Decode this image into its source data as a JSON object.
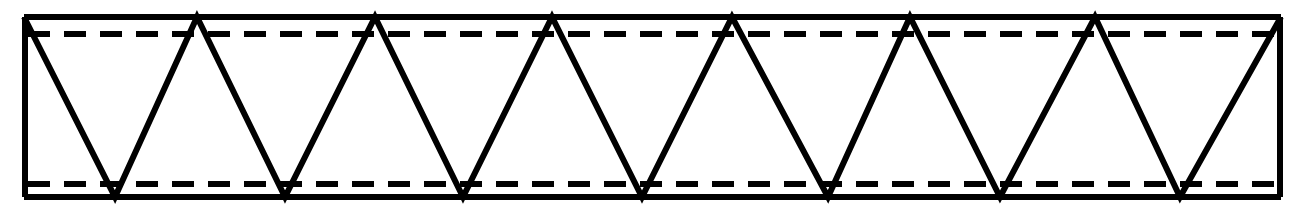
{
  "figure": {
    "type": "engineering-line-diagram",
    "background_color": "#ffffff",
    "ink_color": "#000000",
    "canvas": {
      "width": 1303,
      "height": 215
    }
  },
  "chart_data": {
    "type": "line",
    "title": "",
    "xlabel": "",
    "ylabel": "",
    "grid": false,
    "legend": null,
    "xlim": [
      0,
      1303
    ],
    "ylim": [
      215,
      0
    ],
    "series": [
      {
        "name": "top-chord",
        "style": "solid",
        "stroke_width": 6,
        "x": [
          24,
          1281
        ],
        "y": [
          17,
          17
        ]
      },
      {
        "name": "bottom-chord",
        "style": "solid",
        "stroke_width": 6,
        "x": [
          24,
          1281
        ],
        "y": [
          197,
          197
        ]
      },
      {
        "name": "left-end-post",
        "style": "solid",
        "stroke_width": 6,
        "x": [
          25,
          25
        ],
        "y": [
          17,
          197
        ]
      },
      {
        "name": "right-end-post",
        "style": "solid",
        "stroke_width": 6,
        "x": [
          1280,
          1280
        ],
        "y": [
          17,
          197
        ]
      },
      {
        "name": "upper-rivet-line",
        "style": "dashed",
        "stroke_width": 6,
        "dash_length": 22,
        "gap_length": 14,
        "x": [
          28,
          1278
        ],
        "y": [
          34,
          34
        ]
      },
      {
        "name": "lower-rivet-line",
        "style": "dashed",
        "stroke_width": 6,
        "dash_length": 22,
        "gap_length": 14,
        "x": [
          28,
          1278
        ],
        "y": [
          184,
          184
        ]
      },
      {
        "name": "zigzag-web-bracing",
        "style": "solid",
        "stroke_width": 6,
        "x": [
          24,
          115,
          197,
          285,
          375,
          463,
          552,
          642,
          732,
          828,
          910,
          1000,
          1095,
          1180,
          1281
        ],
        "y": [
          17,
          197,
          17,
          197,
          17,
          197,
          17,
          197,
          17,
          197,
          17,
          197,
          17,
          197,
          17
        ]
      }
    ],
    "top_apex_x": [
      24,
      197,
      375,
      552,
      732,
      910,
      1095,
      1281
    ],
    "bottom_apex_x": [
      115,
      285,
      463,
      642,
      828,
      1000,
      1180
    ],
    "top_apex_y": 17,
    "bottom_apex_y": 197,
    "panel_count": 14
  }
}
